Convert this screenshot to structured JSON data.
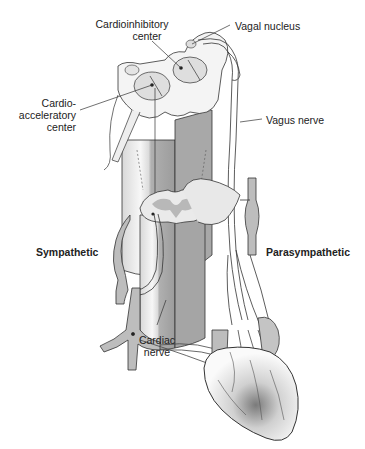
{
  "diagram": {
    "type": "anatomical illustration",
    "labels": {
      "cardioinhibitory": [
        "Cardioinhibitory",
        "center"
      ],
      "vagal_nucleus": "Vagal nucleus",
      "cardioaccelerator": [
        "Cardio-",
        "acceleratory",
        "center"
      ],
      "vagus_nerve": "Vagus nerve",
      "sympathetic": "Sympathetic",
      "parasympathetic": "Parasympathetic",
      "cardiac_nerve": [
        "Cardiac",
        "nerve"
      ]
    },
    "colors": {
      "outline": "#333333",
      "fill_light": "#f2f2f2",
      "fill_mid": "#c8c8c8",
      "fill_dark": "#9a9a9a",
      "text": "#222222"
    }
  }
}
